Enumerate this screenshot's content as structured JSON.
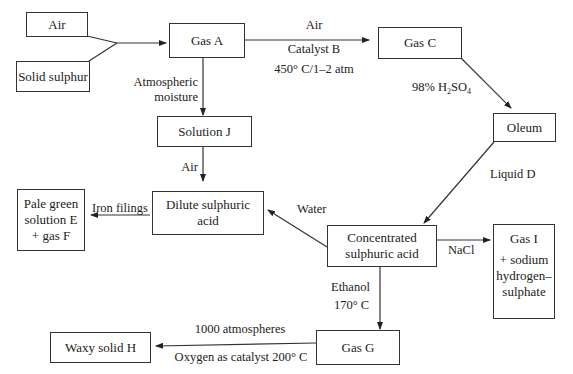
{
  "diagram": {
    "nodes": {
      "air": "Air",
      "solid_sulphur": "Solid sulphur",
      "gas_a": "Gas A",
      "gas_c": "Gas C",
      "oleum": "Oleum",
      "solution_j": "Solution J",
      "dilute_acid": [
        "Dilute sulphuric",
        "acid"
      ],
      "pale_green": [
        "Pale green",
        "solution E",
        "+ gas F"
      ],
      "conc_acid": [
        "Concentrated",
        "sulphuric acid"
      ],
      "gas_i": [
        "Gas I",
        "+ sodium",
        "hydrogen–",
        "sulphate"
      ],
      "gas_g": "Gas G",
      "waxy_solid": "Waxy solid H"
    },
    "edges": {
      "a_to_c_top": "Air",
      "a_to_c_mid": "Catalyst B",
      "a_to_c_bottom": "450° C/1–2 atm",
      "a_to_j": [
        "Atmospheric",
        "moisture"
      ],
      "c_to_oleum_prefix": "98% H",
      "c_to_oleum_sub1": "2",
      "c_to_oleum_mid": "SO",
      "c_to_oleum_sub2": "4",
      "oleum_to_conc": "Liquid D",
      "j_to_dilute": "Air",
      "dilute_to_e": "Iron filings",
      "conc_to_dilute": "Water",
      "conc_to_i": "NaCl",
      "conc_to_g_top": "Ethanol",
      "conc_to_g_bottom": "170° C",
      "g_to_h_top": "1000 atmospheres",
      "g_to_h_bottom": "Oxygen as catalyst 200° C"
    }
  }
}
